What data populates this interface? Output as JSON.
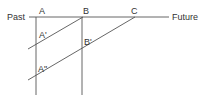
{
  "diagram": {
    "labels": {
      "past": "Past",
      "future": "Future",
      "a": "A",
      "b": "B",
      "c": "C",
      "a_prime": "A'",
      "b_prime": "B'",
      "a_double_prime": "A\""
    },
    "colors": {
      "line": "#555555",
      "text": "#333333",
      "background": "#ffffff"
    }
  }
}
